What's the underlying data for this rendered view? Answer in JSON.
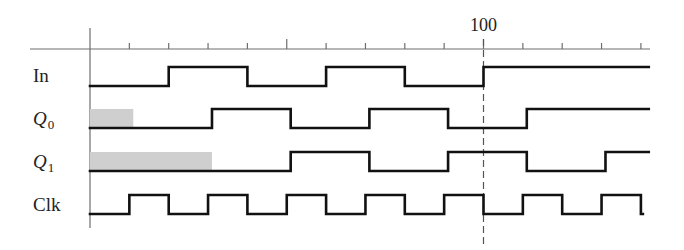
{
  "diagram": {
    "type": "timing-diagram",
    "axis": {
      "y": 49,
      "x_start": 30,
      "x_end": 650,
      "origin_x": 90,
      "origin_line_top": 28,
      "origin_line_bottom": 228,
      "px_per_unit": 3.935,
      "tick_every": 10,
      "ticks": [
        0,
        10,
        20,
        30,
        40,
        50,
        60,
        70,
        80,
        90,
        100,
        110,
        120,
        130,
        140
      ],
      "major_ticks": [
        50,
        100
      ],
      "labeled_tick": {
        "value": 100,
        "label": "100"
      },
      "marker_line": {
        "at": 100,
        "style": "dashed",
        "bottom": 248
      },
      "color": "#6e6e6e"
    },
    "colors": {
      "waveform": "#111111",
      "unknown_fill": "#cfcfcf",
      "axis": "#6e6e6e",
      "text": "#222222"
    },
    "signals": [
      {
        "id": "in",
        "label": "In",
        "subscript": "",
        "italic": false,
        "label_y": 82,
        "high_y": 67,
        "low_y": 86,
        "initial": 0,
        "edges": [
          20,
          40,
          60,
          80,
          100
        ],
        "end": 142,
        "unknown_until": null
      },
      {
        "id": "q0",
        "label": "Q",
        "subscript": "0",
        "italic": true,
        "label_y": 125,
        "high_y": 109,
        "low_y": 128,
        "initial": 0,
        "edges": [
          31,
          51,
          71,
          91,
          111
        ],
        "end": 142,
        "unknown_until": 11
      },
      {
        "id": "q1",
        "label": "Q",
        "subscript": "1",
        "italic": true,
        "label_y": 168,
        "high_y": 152,
        "low_y": 171,
        "initial": 0,
        "edges": [
          51,
          71,
          91,
          111,
          131
        ],
        "end": 142,
        "unknown_until": 31
      },
      {
        "id": "clk",
        "label": "Clk",
        "subscript": "",
        "italic": false,
        "label_y": 211,
        "high_y": 195,
        "low_y": 214,
        "initial": 0,
        "edges": [
          10,
          20,
          30,
          40,
          50,
          60,
          70,
          80,
          90,
          100,
          110,
          120,
          130,
          140
        ],
        "end": 140.5,
        "end_drop": true,
        "unknown_until": null
      }
    ]
  }
}
